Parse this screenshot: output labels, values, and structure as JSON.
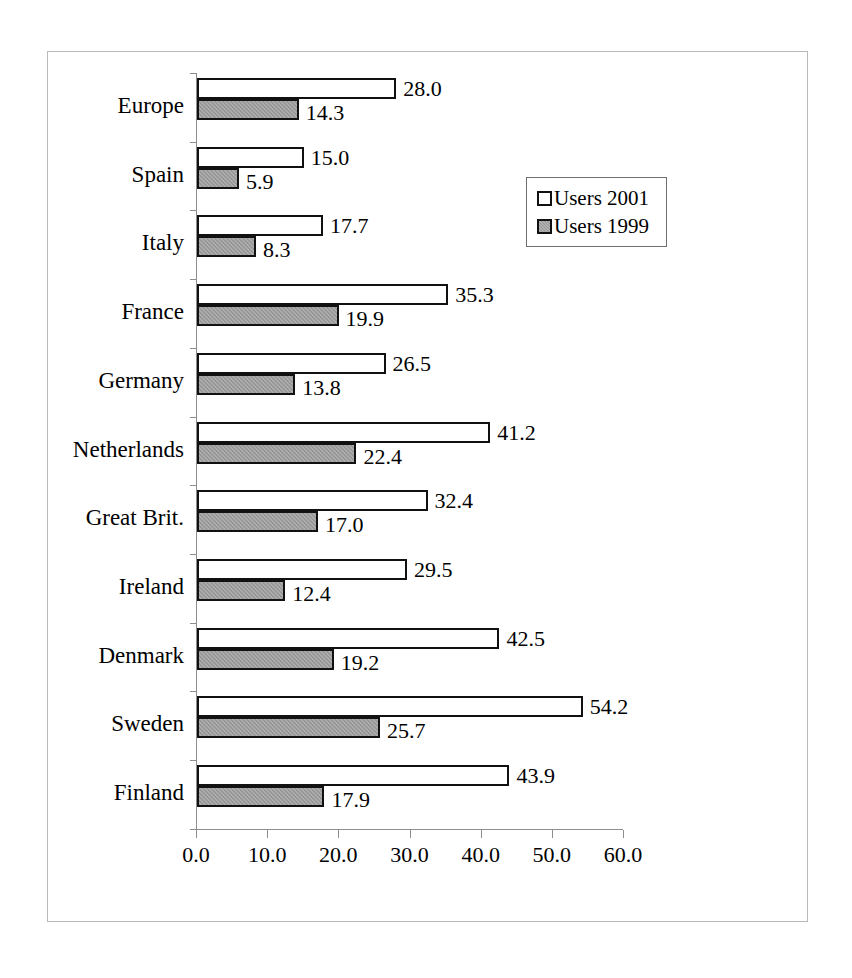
{
  "chart_data": {
    "type": "bar",
    "orientation": "horizontal",
    "title": "",
    "xlabel": "",
    "ylabel": "",
    "xlim": [
      0.0,
      60.0
    ],
    "xticks": [
      "0.0",
      "10.0",
      "20.0",
      "30.0",
      "40.0",
      "50.0",
      "60.0"
    ],
    "xtick_values": [
      0,
      10,
      20,
      30,
      40,
      50,
      60
    ],
    "grid": false,
    "legend_position": "middle-right",
    "categories": [
      "Europe",
      "Spain",
      "Italy",
      "France",
      "Germany",
      "Netherlands",
      "Great Brit.",
      "Ireland",
      "Denmark",
      "Sweden",
      "Finland"
    ],
    "series": [
      {
        "name": "Users 2001",
        "color": "#ffffff",
        "values": [
          28.0,
          15.0,
          17.7,
          35.3,
          26.5,
          41.2,
          32.4,
          29.5,
          42.5,
          54.2,
          43.9
        ],
        "labels": [
          "28.0",
          "15.0",
          "17.7",
          "35.3",
          "26.5",
          "41.2",
          "32.4",
          "29.5",
          "42.5",
          "54.2",
          "43.9"
        ]
      },
      {
        "name": "Users 1999",
        "color": "#969696",
        "values": [
          14.3,
          5.9,
          8.3,
          19.9,
          13.8,
          22.4,
          17.0,
          12.4,
          19.2,
          25.7,
          17.9
        ],
        "labels": [
          "14.3",
          "5.9",
          "8.3",
          "19.9",
          "13.8",
          "22.4",
          "17.0",
          "12.4",
          "19.2",
          "25.7",
          "17.9"
        ]
      }
    ]
  },
  "legend": {
    "entries": [
      {
        "label": "Users 2001",
        "swatch": "white-square-outline"
      },
      {
        "label": "Users 1999",
        "swatch": "gray-filled-square"
      }
    ]
  },
  "colors": {
    "bar_outline": "#111111",
    "series_1999_fill": "#969696",
    "axis": "#8e8e8e",
    "frame_border": "#b9b9b9"
  }
}
